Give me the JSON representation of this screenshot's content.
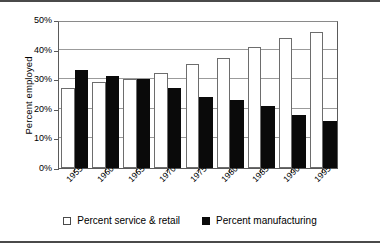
{
  "chart_data": {
    "type": "bar",
    "title": "",
    "subtitle": "",
    "xlabel": "",
    "ylabel": "Percent employed",
    "categories": [
      "1955",
      "1960",
      "1965",
      "1970",
      "1975",
      "1980",
      "1985",
      "1990",
      "1995"
    ],
    "series": [
      {
        "name": "Percent service & retail",
        "color": "#ffffff",
        "edge_color": "#6d6d6d",
        "values": [
          27,
          29,
          30,
          32,
          35,
          37,
          41,
          44,
          46
        ]
      },
      {
        "name": "Percent manufacturing",
        "color": "#0a0a0a",
        "edge_color": "#0a0a0a",
        "values": [
          33,
          31,
          30,
          27,
          24,
          23,
          21,
          18,
          16
        ]
      }
    ],
    "ylim": [
      0,
      50
    ],
    "yticks": [
      0,
      10,
      20,
      30,
      40,
      50
    ],
    "ytick_labels": [
      "0%",
      "10%",
      "20%",
      "30%",
      "40%",
      "50%"
    ],
    "grid": "horizontal",
    "legend_position": "bottom",
    "xtick_label_rotation": -45
  },
  "legend": {
    "items": [
      {
        "label": "Percent service & retail",
        "swatch": "white-square-icon"
      },
      {
        "label": "Percent manufacturing",
        "swatch": "black-square-icon"
      }
    ]
  },
  "axis": {
    "y_title": "Percent employed"
  }
}
